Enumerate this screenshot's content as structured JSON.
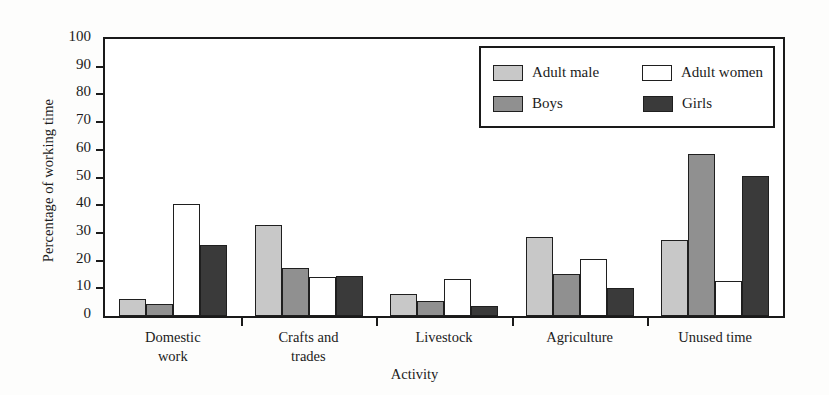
{
  "chart_data": {
    "type": "bar",
    "title": "",
    "subtitle": "",
    "xlabel": "Activity",
    "ylabel": "Percentage of working time",
    "categories": [
      "Domestic work",
      "Crafts and trades",
      "Livestock",
      "Agriculture",
      "Unused time"
    ],
    "category_lines": [
      [
        "Domestic",
        "work"
      ],
      [
        "Crafts and",
        "trades"
      ],
      [
        "Livestock"
      ],
      [
        "Agriculture"
      ],
      [
        "Unused time"
      ]
    ],
    "series": [
      {
        "name": "Adult male",
        "color": "#c8c8c8",
        "values": [
          6,
          33,
          8,
          28.5,
          27.5
        ]
      },
      {
        "name": "Boys",
        "color": "#909090",
        "values": [
          4.5,
          17.5,
          5.5,
          15,
          58.5
        ]
      },
      {
        "name": "Adult women",
        "color": "#ffffff",
        "values": [
          40.5,
          14,
          13.5,
          20.5,
          12.5
        ]
      },
      {
        "name": "Girls",
        "color": "#3a3a3a",
        "values": [
          25.5,
          14.3,
          3.5,
          10,
          50.5
        ]
      }
    ],
    "ylim": [
      0,
      100
    ],
    "yticks": [
      0,
      10,
      20,
      30,
      40,
      50,
      60,
      70,
      80,
      90,
      100
    ],
    "ytick_labels": [
      "0",
      "10",
      "20",
      "30",
      "40",
      "50",
      "60",
      "70",
      "80",
      "90",
      "100"
    ],
    "grid": false,
    "legend_position": "top-right",
    "legend_entries": [
      "Adult male",
      "Adult women",
      "Boys",
      "Girls"
    ],
    "bar_order_in_group": [
      "Adult male",
      "Boys",
      "Adult women",
      "Girls"
    ]
  },
  "legend": {
    "row1": {
      "left_label": "Adult male",
      "right_label": "Adult women"
    },
    "row2": {
      "left_label": "Boys",
      "right_label": "Girls"
    }
  },
  "axes": {
    "y_title": "Percentage of working time",
    "x_title": "Activity"
  },
  "colors": {
    "adult_male": "#c8c8c8",
    "boys": "#909090",
    "adult_women": "#ffffff",
    "girls": "#3a3a3a",
    "frame": "#1a1a1a",
    "background": "#fdfdfc"
  }
}
